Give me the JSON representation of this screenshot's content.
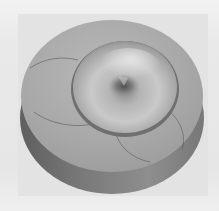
{
  "figure": {
    "colors": {
      "background": "#ebebeb",
      "panel": "#e3e3e3",
      "top_face": "#a9a9a9",
      "top_face_light": "#bdbdbd",
      "side_wall_dark": "#6e6e6e",
      "side_wall_mid": "#8a8a8a",
      "dome_light": "#cfcfcf",
      "dome_mid": "#a0a0a0",
      "dome_dark": "#6a6a6a",
      "seam_line": "#5a5a5a"
    }
  }
}
